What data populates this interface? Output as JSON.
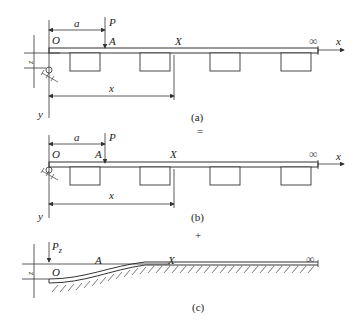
{
  "figure": {
    "panel_a": {
      "label_a": "a",
      "label_P": "P",
      "label_O": "O",
      "label_A": "A",
      "label_X": "X",
      "label_inf": "∞",
      "label_x_axis": "x",
      "label_x_dim": "x",
      "label_y": "y",
      "label_z": "z",
      "caption": "(a)"
    },
    "equals_sign": "=",
    "panel_b": {
      "label_a": "a",
      "label_P": "P",
      "label_O": "O",
      "label_A": "A",
      "label_X": "X",
      "label_inf": "∞",
      "label_x_axis": "x",
      "label_x_dim": "x",
      "label_y": "y",
      "caption": "(b)"
    },
    "plus_sign": "+",
    "panel_c": {
      "label_Pz": "P",
      "label_Pz_sub": "z",
      "label_O": "O",
      "label_A": "A",
      "label_X": "X",
      "label_inf": "∞",
      "label_z": "z",
      "caption": "(c)"
    }
  }
}
